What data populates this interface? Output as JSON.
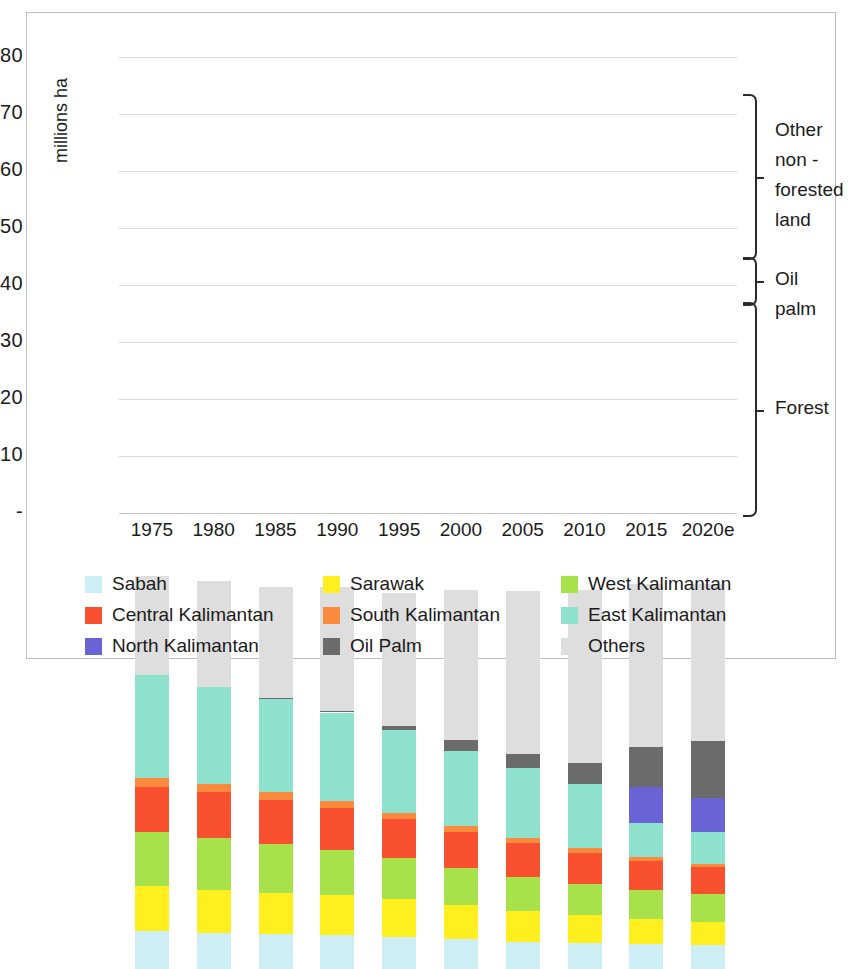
{
  "chart_data": {
    "type": "bar",
    "stacked": true,
    "title": "",
    "xlabel": "",
    "ylabel": "millions ha",
    "ylim": [
      0,
      80
    ],
    "yticks": [
      "-",
      "10",
      "20",
      "30",
      "40",
      "50",
      "60",
      "70",
      "80"
    ],
    "ytick_values": [
      0,
      10,
      20,
      30,
      40,
      50,
      60,
      70,
      80
    ],
    "grid": true,
    "legend_position": "bottom",
    "categories": [
      "1975",
      "1980",
      "1985",
      "1990",
      "1995",
      "2000",
      "2005",
      "2010",
      "2015",
      "2020e"
    ],
    "series": [
      {
        "name": "Sabah",
        "color": "#cdeef5",
        "values": [
          6.7,
          6.4,
          6.1,
          5.9,
          5.6,
          5.2,
          4.8,
          4.5,
          4.3,
          4.2
        ]
      },
      {
        "name": "Sarawak",
        "color": "#ffef1f",
        "values": [
          7.8,
          7.4,
          7.2,
          7.0,
          6.6,
          6.0,
          5.4,
          4.9,
          4.4,
          4.0
        ]
      },
      {
        "name": "West Kalimantan",
        "color": "#a8e24a",
        "values": [
          9.5,
          9.2,
          8.7,
          8.0,
          7.3,
          6.5,
          6.0,
          5.5,
          5.2,
          4.9
        ]
      },
      {
        "name": "Central Kalimantan",
        "color": "#f9502f",
        "values": [
          8.0,
          8.0,
          7.6,
          7.3,
          6.8,
          6.4,
          5.9,
          5.5,
          5.1,
          4.8
        ]
      },
      {
        "name": "South Kalimantan",
        "color": "#fb8a3c",
        "values": [
          1.5,
          1.5,
          1.4,
          1.3,
          1.1,
          1.0,
          0.9,
          0.8,
          0.7,
          0.6
        ]
      },
      {
        "name": "East Kalimantan",
        "color": "#8ee2cd",
        "values": [
          18.0,
          17.0,
          16.3,
          15.5,
          14.5,
          13.1,
          12.2,
          11.3,
          5.9,
          5.5
        ]
      },
      {
        "name": "North Kalimantan",
        "color": "#6a63d6",
        "values": [
          0,
          0,
          0,
          0,
          0,
          0,
          0,
          0,
          6.4,
          6.0
        ]
      },
      {
        "name": "Oil Palm",
        "color": "#6b6b6b",
        "values": [
          0,
          0,
          0.2,
          0.3,
          0.7,
          2.0,
          2.6,
          3.6,
          7.0,
          10.0
        ]
      },
      {
        "name": "Others",
        "color": "#dedede",
        "values": [
          17.5,
          18.5,
          19.5,
          21.7,
          23.4,
          26.3,
          28.6,
          30.4,
          28.5,
          27.5
        ]
      }
    ]
  },
  "yaxis": {
    "label": "millions ha"
  },
  "brackets": [
    {
      "id": "other-non-forested-land",
      "label": "Other\nnon -\nforested\nland",
      "lines": [
        "Other",
        "non -",
        "forested",
        "land"
      ],
      "from": 45.0,
      "to": 73.5
    },
    {
      "id": "oil-palm",
      "label": "Oil palm",
      "lines": [
        "Oil palm"
      ],
      "from": 37.0,
      "to": 45.0
    },
    {
      "id": "forest",
      "label": "Forest",
      "lines": [
        "Forest"
      ],
      "from": 0,
      "to": 37.0
    }
  ],
  "legend": {
    "items": [
      {
        "label": "Sabah",
        "color": "#cdeef5",
        "textured": false
      },
      {
        "label": "Sarawak",
        "color": "#ffef1f",
        "textured": false
      },
      {
        "label": "West Kalimantan",
        "color": "#a8e24a",
        "textured": false
      },
      {
        "label": "Central Kalimantan",
        "color": "#f9502f",
        "textured": false
      },
      {
        "label": "South Kalimantan",
        "color": "#fb8a3c",
        "textured": false
      },
      {
        "label": "East Kalimantan",
        "color": "#8ee2cd",
        "textured": true
      },
      {
        "label": "North Kalimantan",
        "color": "#6a63d6",
        "textured": false
      },
      {
        "label": "Oil Palm",
        "color": "#6b6b6b",
        "textured": true
      },
      {
        "label": "Others",
        "color": "#dedede",
        "textured": true
      }
    ]
  }
}
